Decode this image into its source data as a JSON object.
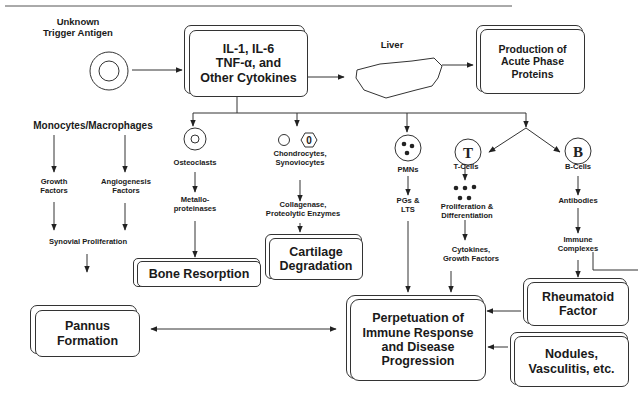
{
  "diagram": {
    "colors": {
      "line": "#333333",
      "text": "#1a1a1a",
      "background": "#ffffff"
    },
    "trigger": {
      "label_line1": "Unknown",
      "label_line2": "Trigger Antigen"
    },
    "cytokines_box": {
      "line1": "IL-1, IL-6",
      "line2": "TNF-α, and",
      "line3": "Other Cytokines"
    },
    "liver": {
      "label": "Liver"
    },
    "acute_phase_box": {
      "line1": "Production of",
      "line2": "Acute Phase",
      "line3": "Proteins"
    },
    "monocytes": {
      "label": "Monocytes/Macrophages",
      "growth_factors": {
        "line1": "Growth",
        "line2": "Factors"
      },
      "angiogenesis_factors": {
        "line1": "Angiogenesis",
        "line2": "Factors"
      },
      "synovial_proliferation": "Synovial Proliferation"
    },
    "osteoclasts": {
      "label": "Osteoclasts",
      "product": {
        "line1": "Metallo-",
        "line2": "proteinases"
      },
      "outcome_box": "Bone Resorption"
    },
    "chondrocytes": {
      "label_line1": "Chondrocytes,",
      "label_line2": "Synoviocytes",
      "glyph_text": "0",
      "product": {
        "line1": "Collagenase,",
        "line2": "Proteolytic Enzymes"
      },
      "outcome_box": {
        "line1": "Cartilage",
        "line2": "Degradation"
      }
    },
    "pmns": {
      "label": "PMNs",
      "product": {
        "line1": "PGs &",
        "line2": "LTS"
      }
    },
    "t_cells": {
      "glyph_text": "T",
      "label": "T-Cells",
      "step1": {
        "line1": "Proliferation &",
        "line2": "Differentiation"
      },
      "step2": {
        "line1": "Cytokines,",
        "line2": "Growth Factors"
      }
    },
    "b_cells": {
      "glyph_text": "B",
      "label": "B-Cells",
      "step1": "Antibodies",
      "step2": {
        "line1": "Immune",
        "line2": "Complexes"
      }
    },
    "pannus_box": {
      "line1": "Pannus",
      "line2": "Formation"
    },
    "perpetuation_box": {
      "line1": "Perpetuation of",
      "line2": "Immune Response",
      "line3": "and Disease",
      "line4": "Progression"
    },
    "rheumatoid_factor_box": {
      "line1": "Rheumatoid",
      "line2": "Factor"
    },
    "nodules_box": {
      "line1": "Nodules,",
      "line2": "Vasculitis, etc."
    }
  }
}
